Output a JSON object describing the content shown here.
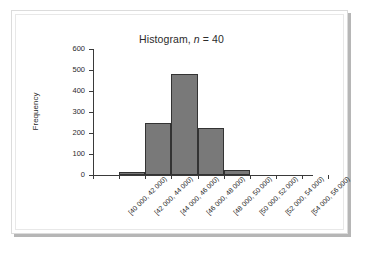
{
  "figure": {
    "frame_color": "#dcdcdc",
    "shadow_color": "#b6b6b6",
    "background": "#ffffff"
  },
  "chart_data": {
    "type": "bar",
    "title": "Histogram, n = 40",
    "title_prefix": "Histogram, ",
    "title_italic": "n",
    "title_suffix": " = 40",
    "xlabel": "",
    "ylabel": "Frequency",
    "ylim": [
      0,
      600
    ],
    "ytick_values": [
      0,
      100,
      200,
      300,
      400,
      500,
      600
    ],
    "ytick_labels": [
      "0",
      "100",
      "200",
      "300",
      "400",
      "500",
      "600"
    ],
    "grid": false,
    "legend": null,
    "bar_fill_color": "#797979",
    "bar_edge_color": "#333333",
    "axis_color": "#3a3a3a",
    "categories": [
      "[40 000, 42 000)",
      "[42 000, 44 000)",
      "[44 000, 46 000)",
      "[46 000, 48 000)",
      "[48 000, 50 000)",
      "[50 000, 52 000)",
      "[52 000, 54 000)",
      "[54 000, 56 000)"
    ],
    "values": [
      0,
      15,
      250,
      480,
      225,
      25,
      0,
      0
    ],
    "n": 40
  }
}
